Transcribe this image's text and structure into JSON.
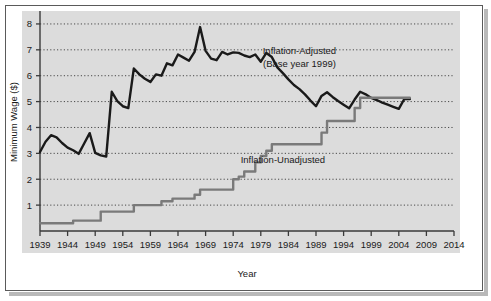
{
  "figure": {
    "background_color": "#ffffff",
    "panel_color": "#dcdcdc",
    "frame_color": "#5a5a5a"
  },
  "chart_data": {
    "type": "line",
    "title": "",
    "xlabel": "Year",
    "ylabel": "Minimum Wage ($)",
    "xlim": [
      1939,
      2014
    ],
    "ylim": [
      0,
      8.5
    ],
    "yticks": [
      1,
      2,
      3,
      4,
      5,
      6,
      7,
      8
    ],
    "ytick_labels": [
      "1",
      "2",
      "3",
      "4",
      "5",
      "6",
      "7",
      "8"
    ],
    "xticks": [
      1939,
      1944,
      1949,
      1954,
      1959,
      1964,
      1969,
      1974,
      1979,
      1984,
      1989,
      1994,
      1999,
      2004,
      2009,
      2014
    ],
    "xtick_labels": [
      "1939",
      "1944",
      "1949",
      "1954",
      "1959",
      "1964",
      "1969",
      "1974",
      "1979",
      "1984",
      "1989",
      "1994",
      "1999",
      "2004",
      "2009",
      "2014"
    ],
    "grid": "horizontal-dotted",
    "legend_position": "inline-annotations",
    "annotations": [
      {
        "id": "adjusted-label-line1",
        "text": "Inflation-Adjusted",
        "x": 1986.0,
        "y": 6.85
      },
      {
        "id": "adjusted-label-line2",
        "text": "(Base year 1999)",
        "x": 1986.0,
        "y": 6.35
      },
      {
        "id": "unadjusted-label",
        "text": "Inflation-Unadjusted",
        "x": 1983.0,
        "y": 2.62
      }
    ],
    "series": [
      {
        "name": "Inflation-Adjusted (Base year 1999)",
        "color": "#1a1a1a",
        "line_width": 2.4,
        "x": [
          1939,
          1940,
          1941,
          1942,
          1943,
          1944,
          1945,
          1946,
          1947,
          1948,
          1949,
          1950,
          1951,
          1952,
          1953,
          1954,
          1955,
          1956,
          1957,
          1958,
          1959,
          1960,
          1961,
          1962,
          1963,
          1964,
          1965,
          1966,
          1967,
          1968,
          1969,
          1970,
          1971,
          1972,
          1973,
          1974,
          1975,
          1976,
          1977,
          1978,
          1979,
          1980,
          1981,
          1982,
          1983,
          1984,
          1985,
          1986,
          1987,
          1988,
          1989,
          1990,
          1991,
          1992,
          1993,
          1994,
          1995,
          1996,
          1997,
          1998,
          1999,
          2000,
          2001,
          2002,
          2003,
          2004,
          2005,
          2006
        ],
        "y": [
          3.05,
          3.45,
          3.7,
          3.62,
          3.4,
          3.22,
          3.12,
          2.98,
          3.38,
          3.78,
          3.02,
          2.92,
          2.88,
          5.38,
          5.02,
          4.82,
          4.75,
          6.28,
          6.05,
          5.88,
          5.76,
          6.05,
          6.0,
          6.48,
          6.4,
          6.82,
          6.7,
          6.58,
          6.92,
          7.88,
          6.96,
          6.66,
          6.6,
          6.92,
          6.82,
          6.9,
          6.88,
          6.78,
          6.72,
          6.82,
          6.54,
          6.88,
          6.72,
          6.32,
          6.1,
          5.86,
          5.64,
          5.48,
          5.28,
          5.04,
          4.82,
          5.22,
          5.36,
          5.18,
          5.02,
          4.88,
          4.74,
          5.08,
          5.38,
          5.28,
          5.14,
          5.06,
          4.96,
          4.88,
          4.8,
          4.72,
          5.1,
          5.1
        ]
      },
      {
        "name": "Inflation-Unadjusted",
        "color": "#7a7a7a",
        "line_width": 2.4,
        "step": true,
        "x": [
          1939,
          1944,
          1945,
          1949,
          1950,
          1955,
          1956,
          1960,
          1961,
          1962,
          1963,
          1966,
          1967,
          1968,
          1969,
          1973,
          1974,
          1975,
          1976,
          1977,
          1978,
          1979,
          1980,
          1981,
          1989,
          1990,
          1991,
          1995,
          1996,
          1997,
          2006
        ],
        "y": [
          0.3,
          0.3,
          0.4,
          0.4,
          0.75,
          0.75,
          1.0,
          1.0,
          1.15,
          1.15,
          1.25,
          1.25,
          1.4,
          1.6,
          1.6,
          1.6,
          2.0,
          2.1,
          2.3,
          2.3,
          2.65,
          2.9,
          3.1,
          3.35,
          3.35,
          3.8,
          4.25,
          4.25,
          4.75,
          5.15,
          5.15
        ]
      }
    ]
  }
}
